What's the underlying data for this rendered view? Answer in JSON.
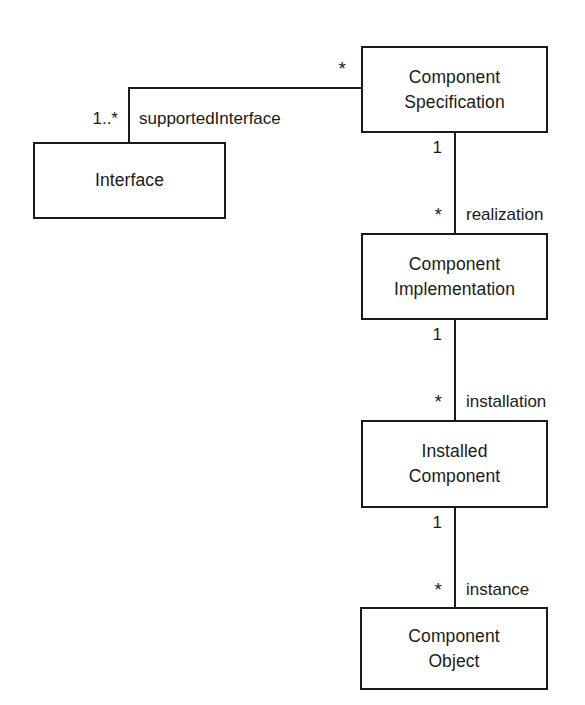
{
  "diagram": {
    "kind": "uml-class-diagram",
    "background_color": "#ffffff",
    "stroke_color": "#1a1a1a",
    "classes": [
      {
        "id": "component-specification",
        "line1": "Component",
        "line2": "Specification"
      },
      {
        "id": "interface",
        "line1": "Interface",
        "line2": ""
      },
      {
        "id": "component-implementation",
        "line1": "Component",
        "line2": "Implementation"
      },
      {
        "id": "installed-component",
        "line1": "Installed",
        "line2": "Component"
      },
      {
        "id": "component-object",
        "line1": "Component",
        "line2": "Object"
      }
    ],
    "associations": [
      {
        "id": "supported-interface",
        "label": "supportedInterface",
        "source": "component-specification",
        "source_multiplicity": "*",
        "target": "interface",
        "target_multiplicity": "1..*"
      },
      {
        "id": "realization",
        "label": "realization",
        "source": "component-specification",
        "source_multiplicity": "1",
        "target": "component-implementation",
        "target_multiplicity": "*"
      },
      {
        "id": "installation",
        "label": "installation",
        "source": "component-implementation",
        "source_multiplicity": "1",
        "target": "installed-component",
        "target_multiplicity": "*"
      },
      {
        "id": "instance",
        "label": "instance",
        "source": "installed-component",
        "source_multiplicity": "1",
        "target": "component-object",
        "target_multiplicity": "*"
      }
    ]
  }
}
